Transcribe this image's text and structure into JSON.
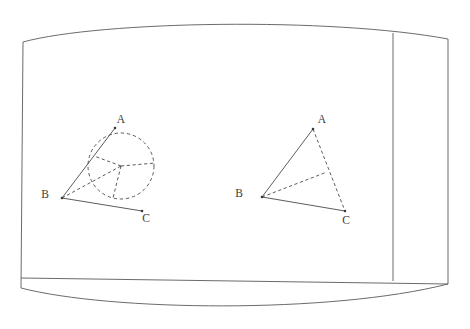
{
  "scene": {
    "title": "Whiteboard with two geometry figures",
    "background_color": "#ffffff",
    "stroke_color": "#4a4a4a",
    "frame_stroke_color": "#5a5a5a"
  },
  "board": {
    "name": "whiteboard-panel",
    "outline_path": "M 23 42 C 100 21 330 17 448 39 L 448 284 C 330 314 110 311 21 288 Z",
    "ledge_line": {
      "x1": 21,
      "y1": 278,
      "x2": 448,
      "y2": 284
    },
    "divider_line": {
      "x1": 393,
      "y1": 33,
      "x2": 393,
      "y2": 281
    }
  },
  "figures": [
    {
      "id": "figure-left",
      "name": "angle-with-inscribed-circle",
      "labels": [
        {
          "text": "A",
          "x": 121,
          "y": 120
        },
        {
          "text": "B",
          "x": 45,
          "y": 195
        },
        {
          "text": "C",
          "x": 146,
          "y": 219
        }
      ],
      "vertices": {
        "A": {
          "x": 115,
          "y": 128
        },
        "B": {
          "x": 62,
          "y": 198
        },
        "C": {
          "x": 142,
          "y": 211
        }
      },
      "circle": {
        "cx": 121,
        "cy": 166,
        "r": 33,
        "style": "dashed"
      },
      "solid_segments": [
        {
          "name": "ray-BA",
          "x1": 62,
          "y1": 198,
          "x2": 115,
          "y2": 128
        },
        {
          "name": "ray-BC",
          "x1": 62,
          "y1": 198,
          "x2": 142,
          "y2": 211
        }
      ],
      "dashed_segments": [
        {
          "name": "radius-to-BA-tangent",
          "x1": 121,
          "y1": 166,
          "x2": 94,
          "y2": 156
        },
        {
          "name": "radius-to-BC-tangent",
          "x1": 121,
          "y1": 166,
          "x2": 113,
          "y2": 198
        },
        {
          "name": "B-to-center",
          "x1": 62,
          "y1": 198,
          "x2": 121,
          "y2": 166
        },
        {
          "name": "center-to-right",
          "x1": 121,
          "y1": 166,
          "x2": 155,
          "y2": 163
        }
      ]
    },
    {
      "id": "figure-right",
      "name": "triangle-with-cevian",
      "labels": [
        {
          "text": "A",
          "x": 322,
          "y": 120
        },
        {
          "text": "B",
          "x": 239,
          "y": 194
        },
        {
          "text": "C",
          "x": 346,
          "y": 221
        }
      ],
      "vertices": {
        "A": {
          "x": 313,
          "y": 129
        },
        "B": {
          "x": 262,
          "y": 197
        },
        "C": {
          "x": 345,
          "y": 211
        }
      },
      "solid_segments": [
        {
          "name": "side-BA",
          "x1": 262,
          "y1": 197,
          "x2": 313,
          "y2": 129
        },
        {
          "name": "side-BC",
          "x1": 262,
          "y1": 197,
          "x2": 345,
          "y2": 211
        }
      ],
      "dashed_segments": [
        {
          "name": "side-AC",
          "x1": 313,
          "y1": 129,
          "x2": 345,
          "y2": 211
        },
        {
          "name": "cevian-B-to-AC",
          "x1": 262,
          "y1": 197,
          "x2": 327,
          "y2": 172
        }
      ]
    }
  ]
}
